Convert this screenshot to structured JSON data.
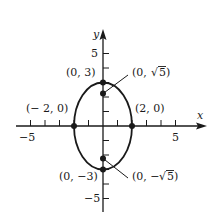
{
  "diagram": {
    "type": "ellipse-graph",
    "equation_hint": "x^2/4 + y^2/9 = 1",
    "axes": {
      "x_label": "x",
      "y_label": "y",
      "x_ticks": {
        "min": -5,
        "max": 5,
        "step": 1,
        "labeled": [
          "-5",
          "5"
        ]
      },
      "y_ticks": {
        "min": -5,
        "max": 5,
        "step": 1,
        "labeled": [
          "5",
          "-5"
        ]
      }
    },
    "labels": {
      "x_neg5": "−5",
      "x_pos5": "5",
      "y_pos5": "5",
      "y_neg5": "−5",
      "x_axis": "x",
      "y_axis": "y"
    },
    "points": [
      {
        "name": "vertex-top",
        "label": "(0, 3)",
        "x": 0,
        "y": 3
      },
      {
        "name": "vertex-bottom",
        "label": "(0, −3)",
        "x": 0,
        "y": -3
      },
      {
        "name": "co-vertex-left",
        "label": "(− 2, 0)",
        "x": -2,
        "y": 0
      },
      {
        "name": "co-vertex-right",
        "label": "(2, 0)",
        "x": 2,
        "y": 0
      },
      {
        "name": "focus-top",
        "label_prefix": "(0, ",
        "label_radicand": "5",
        "label_suffix": ")",
        "x": 0,
        "y": 2.236
      },
      {
        "name": "focus-bottom",
        "label_prefix": "(0, −",
        "label_radicand": "5",
        "label_suffix": ")",
        "x": 0,
        "y": -2.236
      }
    ],
    "colors": {
      "stroke": "#1a1a1a",
      "background": "#ffffff"
    }
  }
}
